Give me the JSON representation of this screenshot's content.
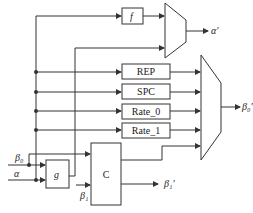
{
  "diagram": {
    "blocks": {
      "f": "f",
      "g": "g",
      "c": "C",
      "rep": "REP",
      "spc": "SPC",
      "rate0": "Rate_0",
      "rate1": "Rate_1"
    },
    "inputs": {
      "beta0": "β₀",
      "alpha": "α",
      "beta1": "β₁"
    },
    "outputs": {
      "alpha_prime": "α′",
      "beta0_prime": "β₀′",
      "beta1_prime": "β₁′"
    },
    "muxes": [
      "top-mux",
      "bottom-mux"
    ],
    "colors": {
      "line": "#333333",
      "background": "#ffffff"
    }
  }
}
